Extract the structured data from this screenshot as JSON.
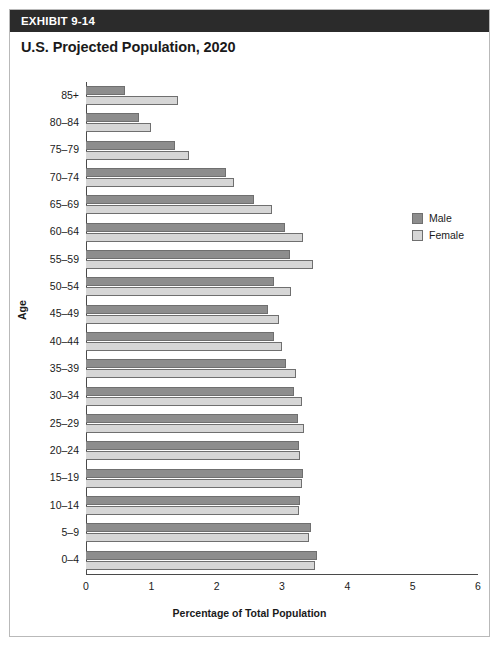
{
  "exhibit": {
    "label": "EXHIBIT 9-14"
  },
  "chart_data": {
    "type": "bar",
    "orientation": "horizontal",
    "title": "U.S. Projected Population, 2020",
    "xlabel": "Percentage of Total Population",
    "ylabel": "Age",
    "xlim": [
      0,
      6
    ],
    "xticks": [
      "0",
      "1",
      "2",
      "3",
      "4",
      "5",
      "6"
    ],
    "grid": false,
    "legend_position": "right",
    "categories": [
      "85+",
      "80–84",
      "75–79",
      "70–74",
      "65–69",
      "60–64",
      "55–59",
      "50–54",
      "45–49",
      "40–44",
      "35–39",
      "30–34",
      "25–29",
      "20–24",
      "15–19",
      "10–14",
      "5–9",
      "0–4"
    ],
    "series": [
      {
        "name": "Male",
        "color": "#8d8d8d",
        "values": [
          0.6,
          0.81,
          1.36,
          2.14,
          2.57,
          3.05,
          3.12,
          2.87,
          2.79,
          2.87,
          3.06,
          3.18,
          3.24,
          3.26,
          3.32,
          3.28,
          3.45,
          3.54
        ]
      },
      {
        "name": "Female",
        "color": "#d6d6d6",
        "values": [
          1.41,
          1.0,
          1.57,
          2.27,
          2.84,
          3.32,
          3.47,
          3.14,
          2.96,
          3.0,
          3.22,
          3.3,
          3.34,
          3.27,
          3.3,
          3.26,
          3.42,
          3.5
        ]
      }
    ]
  }
}
